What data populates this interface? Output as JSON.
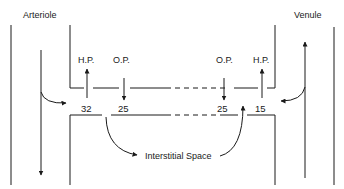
{
  "labels": {
    "arteriole": "Arteriole",
    "venule": "Venule",
    "hp_left": "H.P.",
    "op_left": "O.P.",
    "op_right": "O.P.",
    "hp_right": "H.P.",
    "interstitial": "Interstitial Space"
  },
  "values": {
    "hp_arterial": "32",
    "op_arterial": "25",
    "op_venous": "25",
    "hp_venous": "15"
  },
  "colors": {
    "line": "#1a1a1a",
    "background": "#ffffff"
  }
}
